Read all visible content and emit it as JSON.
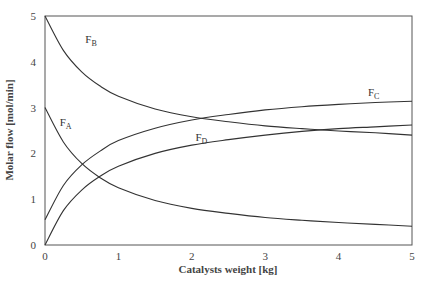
{
  "chart_data": {
    "type": "line",
    "title": "",
    "xlabel": "Catalysts weight [kg]",
    "ylabel": "Molar flow [mol/min]",
    "xlim": [
      0,
      5
    ],
    "ylim": [
      0,
      5
    ],
    "xticks": [
      "0",
      "1",
      "2",
      "3",
      "4",
      "5"
    ],
    "yticks": [
      "0",
      "1",
      "2",
      "3",
      "4",
      "5"
    ],
    "grid": false,
    "legend": "inline curve labels",
    "x": [
      0,
      0.25,
      0.5,
      0.75,
      1.0,
      1.5,
      2.0,
      2.5,
      3.0,
      3.5,
      4.0,
      4.5,
      5.0
    ],
    "series": [
      {
        "name": "F_A",
        "label_main": "F",
        "label_sub": "A",
        "values": [
          3.0,
          2.25,
          1.78,
          1.47,
          1.25,
          0.97,
          0.8,
          0.69,
          0.6,
          0.54,
          0.49,
          0.45,
          0.41
        ]
      },
      {
        "name": "F_B",
        "label_main": "F",
        "label_sub": "B",
        "values": [
          5.0,
          4.25,
          3.78,
          3.47,
          3.25,
          2.97,
          2.8,
          2.69,
          2.6,
          2.54,
          2.49,
          2.45,
          2.4
        ]
      },
      {
        "name": "F_C",
        "label_main": "F",
        "label_sub": "C",
        "values": [
          0.55,
          1.3,
          1.75,
          2.05,
          2.28,
          2.55,
          2.73,
          2.85,
          2.95,
          3.02,
          3.07,
          3.11,
          3.14
        ]
      },
      {
        "name": "F_D",
        "label_main": "F",
        "label_sub": "D",
        "values": [
          0.0,
          0.75,
          1.2,
          1.5,
          1.72,
          2.0,
          2.18,
          2.3,
          2.4,
          2.48,
          2.54,
          2.58,
          2.62
        ]
      }
    ],
    "annotations": [
      {
        "text": "F_A",
        "x": 0.2,
        "y": 2.6
      },
      {
        "text": "F_B",
        "x": 0.55,
        "y": 4.4
      },
      {
        "text": "F_C",
        "x": 4.4,
        "y": 3.25
      },
      {
        "text": "F_D",
        "x": 2.05,
        "y": 2.28
      }
    ]
  }
}
